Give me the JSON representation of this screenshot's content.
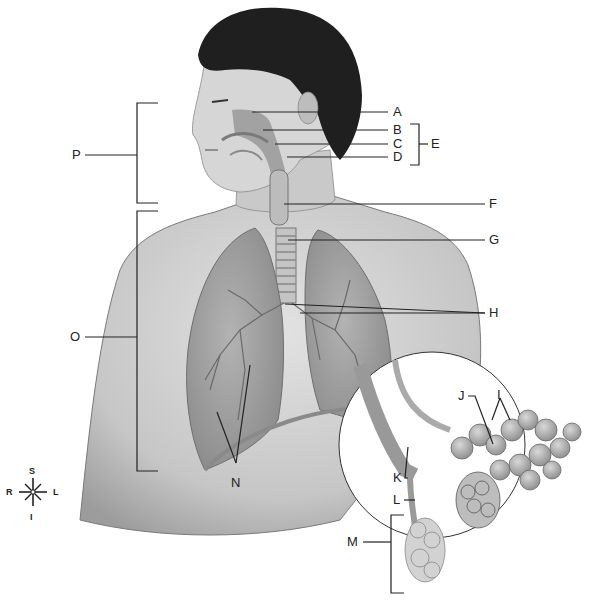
{
  "diagram": {
    "labels": {
      "A": "A",
      "B": "B",
      "C": "C",
      "D": "D",
      "E": "E",
      "F": "F",
      "G": "G",
      "H": "H",
      "I": "I",
      "J": "J",
      "K": "K",
      "L": "L",
      "M": "M",
      "N": "N",
      "O": "O",
      "P": "P"
    },
    "compass": {
      "superior": "S",
      "inferior": "I",
      "right": "R",
      "left": "L"
    },
    "colors": {
      "ink": "#222222",
      "skin": "#cfcfcf",
      "skin_shade": "#a8a8a8",
      "hair": "#1e1e1e",
      "lung": "#9a9a9a",
      "background": "#ffffff"
    }
  }
}
